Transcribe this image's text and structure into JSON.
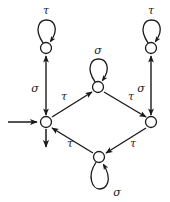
{
  "figure": {
    "stroke_color": "#1a1a1a",
    "background_color": "#ffffff",
    "node_fill": "#ffffff"
  },
  "states": [
    {
      "id": "q0",
      "name": "initial-state",
      "label": "",
      "cx": 46,
      "cy": 122,
      "r": 5.5,
      "initial": true
    },
    {
      "id": "q1",
      "name": "upper-left-state",
      "label": "",
      "cx": 46,
      "cy": 48,
      "r": 5.5,
      "initial": false
    },
    {
      "id": "q2",
      "name": "upper-middle-state",
      "label": "",
      "cx": 98,
      "cy": 87,
      "r": 5.5,
      "initial": false
    },
    {
      "id": "q3",
      "name": "upper-right-state",
      "label": "",
      "cx": 151,
      "cy": 48,
      "r": 5.5,
      "initial": false
    },
    {
      "id": "q4",
      "name": "right-state",
      "label": "",
      "cx": 151,
      "cy": 122,
      "r": 5.5,
      "initial": false
    },
    {
      "id": "q5",
      "name": "bottom-state",
      "label": "",
      "cx": 99,
      "cy": 157,
      "r": 5.5,
      "initial": false
    }
  ],
  "self_loops": [
    {
      "id": "loop-q1",
      "state": "q1",
      "label": "τ",
      "label_x": 46,
      "label_y": 14,
      "direction": "up"
    },
    {
      "id": "loop-q2",
      "state": "q2",
      "label": "σ",
      "label_x": 98,
      "label_y": 54,
      "direction": "up"
    },
    {
      "id": "loop-q3",
      "state": "q3",
      "label": "τ",
      "label_x": 151,
      "label_y": 14,
      "direction": "up"
    },
    {
      "id": "loop-q5",
      "state": "q5",
      "label": "σ",
      "label_x": 117,
      "label_y": 194,
      "direction": "down"
    }
  ],
  "transitions": [
    {
      "id": "t-q0-q1",
      "from": "q0",
      "to": "q1",
      "label": "σ",
      "label_x": 36,
      "label_y": 88,
      "bidirectional": true
    },
    {
      "id": "t-q3-q4",
      "from": "q3",
      "to": "q4",
      "label": "σ",
      "label_x": 141,
      "label_y": 88,
      "bidirectional": true
    },
    {
      "id": "t-q0-q2",
      "from": "q0",
      "to": "q2",
      "label": "τ",
      "label_x": 65,
      "label_y": 97,
      "bidirectional": false
    },
    {
      "id": "t-q2-q4",
      "from": "q2",
      "to": "q4",
      "label": "τ",
      "label_x": 130,
      "label_y": 97,
      "bidirectional": false
    },
    {
      "id": "t-q4-q5",
      "from": "q4",
      "to": "q5",
      "label": "τ",
      "label_x": 132,
      "label_y": 144,
      "bidirectional": false
    },
    {
      "id": "t-q5-q0",
      "from": "q5",
      "to": "q0",
      "label": "τ",
      "label_x": 70,
      "label_y": 144,
      "bidirectional": false
    }
  ],
  "dangling": [
    {
      "id": "entry-arrow",
      "name": "initial-state-entry-arrow",
      "x1": 8,
      "y1": 122,
      "x2": 38,
      "y2": 122
    },
    {
      "id": "exit-arrow",
      "name": "initial-state-exit-arrow",
      "x1": 46,
      "y1": 128,
      "x2": 46,
      "y2": 148
    }
  ],
  "alphabet": {
    "tau": "τ",
    "sigma": "σ"
  }
}
